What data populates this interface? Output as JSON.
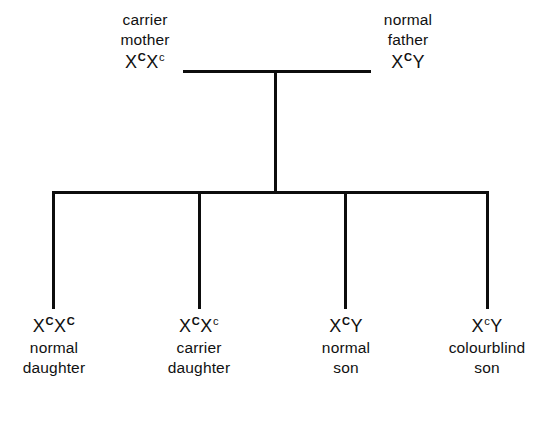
{
  "diagram": {
    "line_color": "#0d0d0d",
    "background_color": "#ffffff"
  },
  "parents": [
    {
      "id": "mother",
      "label_line1": "carrier",
      "label_line2": "mother",
      "genotype": {
        "allele1_symbol": "X",
        "allele1_sup": "C",
        "allele1_type": "dom",
        "allele2_symbol": "X",
        "allele2_sup": "c",
        "allele2_type": "rec"
      }
    },
    {
      "id": "father",
      "label_line1": "normal",
      "label_line2": "father",
      "genotype": {
        "allele1_symbol": "X",
        "allele1_sup": "C",
        "allele1_type": "dom",
        "allele2_symbol": "Y",
        "allele2_sup": "",
        "allele2_type": "none"
      }
    }
  ],
  "children": [
    {
      "id": "child1",
      "genotype": {
        "allele1_symbol": "X",
        "allele1_sup": "C",
        "allele1_type": "dom",
        "allele2_symbol": "X",
        "allele2_sup": "C",
        "allele2_type": "dom"
      },
      "label_line1": "normal",
      "label_line2": "daughter"
    },
    {
      "id": "child2",
      "genotype": {
        "allele1_symbol": "X",
        "allele1_sup": "C",
        "allele1_type": "dom",
        "allele2_symbol": "X",
        "allele2_sup": "c",
        "allele2_type": "rec"
      },
      "label_line1": "carrier",
      "label_line2": "daughter"
    },
    {
      "id": "child3",
      "genotype": {
        "allele1_symbol": "X",
        "allele1_sup": "C",
        "allele1_type": "dom",
        "allele2_symbol": "Y",
        "allele2_sup": "",
        "allele2_type": "none"
      },
      "label_line1": "normal",
      "label_line2": "son"
    },
    {
      "id": "child4",
      "genotype": {
        "allele1_symbol": "X",
        "allele1_sup": "c",
        "allele1_type": "rec",
        "allele2_symbol": "Y",
        "allele2_sup": "",
        "allele2_type": "none"
      },
      "label_line1": "colourblind",
      "label_line2": "son"
    }
  ]
}
